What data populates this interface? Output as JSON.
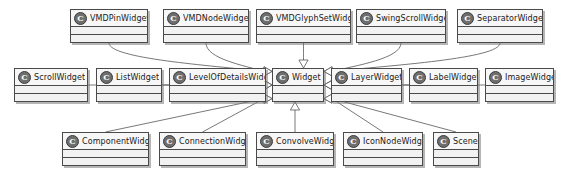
{
  "diagram": {
    "type": "uml-class-diagram",
    "relationship": "generalization",
    "background_color": "#ffffff",
    "box_fill_color": "#f2f2f2",
    "box_border_color": "#4a4a4a",
    "icon_label": "C",
    "width": 564,
    "height": 176
  },
  "classes": [
    {
      "id": "vmdpin",
      "name": "VMDPinWidget",
      "icon": "class-icon",
      "x": 70,
      "y": 9,
      "w": 78
    },
    {
      "id": "vmdnode",
      "name": "VMDNodeWidget",
      "icon": "class-icon",
      "x": 163,
      "y": 9,
      "w": 86
    },
    {
      "id": "vmdglyphset",
      "name": "VMDGlyphSetWidget",
      "icon": "class-icon",
      "x": 256,
      "y": 9,
      "w": 95
    },
    {
      "id": "swingscroll",
      "name": "SwingScrollWidget",
      "icon": "class-icon",
      "x": 356,
      "y": 9,
      "w": 90
    },
    {
      "id": "separator",
      "name": "SeparatorWidget",
      "icon": "class-icon",
      "x": 457,
      "y": 9,
      "w": 86
    },
    {
      "id": "scroll",
      "name": "ScrollWidget",
      "icon": "class-icon",
      "x": 14,
      "y": 68,
      "w": 74
    },
    {
      "id": "list",
      "name": "ListWidget",
      "icon": "class-icon",
      "x": 96,
      "y": 68,
      "w": 66
    },
    {
      "id": "levelofdetail",
      "name": "LevelOfDetailsWidget",
      "icon": "class-icon",
      "x": 169,
      "y": 68,
      "w": 97
    },
    {
      "id": "widget",
      "name": "Widget",
      "icon": "class-icon",
      "x": 272,
      "y": 68,
      "w": 52
    },
    {
      "id": "layer",
      "name": "LayerWidget",
      "icon": "class-icon",
      "x": 331,
      "y": 68,
      "w": 71
    },
    {
      "id": "label",
      "name": "LabelWidget",
      "icon": "class-icon",
      "x": 409,
      "y": 68,
      "w": 69
    },
    {
      "id": "image",
      "name": "ImageWidget",
      "icon": "class-icon",
      "x": 485,
      "y": 68,
      "w": 69
    },
    {
      "id": "component",
      "name": "ComponentWidget",
      "icon": "class-icon",
      "x": 62,
      "y": 132,
      "w": 87
    },
    {
      "id": "connection",
      "name": "ConnectionWidget",
      "icon": "class-icon",
      "x": 159,
      "y": 132,
      "w": 87
    },
    {
      "id": "convolve",
      "name": "ConvolveWidget",
      "icon": "class-icon",
      "x": 256,
      "y": 132,
      "w": 78
    },
    {
      "id": "iconnode",
      "name": "IconNodeWidget",
      "icon": "class-icon",
      "x": 343,
      "y": 132,
      "w": 80
    },
    {
      "id": "scene",
      "name": "Scene",
      "icon": "class-icon",
      "x": 433,
      "y": 132,
      "w": 46
    }
  ],
  "edges": [
    {
      "from": "vmdpin",
      "to": "widget",
      "kind": "generalization"
    },
    {
      "from": "vmdnode",
      "to": "widget",
      "kind": "generalization"
    },
    {
      "from": "vmdglyphset",
      "to": "widget",
      "kind": "generalization"
    },
    {
      "from": "swingscroll",
      "to": "widget",
      "kind": "generalization"
    },
    {
      "from": "separator",
      "to": "widget",
      "kind": "generalization"
    },
    {
      "from": "scroll",
      "to": "widget",
      "kind": "generalization"
    },
    {
      "from": "list",
      "to": "widget",
      "kind": "generalization"
    },
    {
      "from": "levelofdetail",
      "to": "widget",
      "kind": "generalization"
    },
    {
      "from": "layer",
      "to": "widget",
      "kind": "generalization"
    },
    {
      "from": "label",
      "to": "widget",
      "kind": "generalization"
    },
    {
      "from": "image",
      "to": "widget",
      "kind": "generalization"
    },
    {
      "from": "component",
      "to": "widget",
      "kind": "generalization"
    },
    {
      "from": "connection",
      "to": "widget",
      "kind": "generalization"
    },
    {
      "from": "convolve",
      "to": "widget",
      "kind": "generalization"
    },
    {
      "from": "iconnode",
      "to": "widget",
      "kind": "generalization"
    },
    {
      "from": "scene",
      "to": "widget",
      "kind": "generalization"
    }
  ]
}
